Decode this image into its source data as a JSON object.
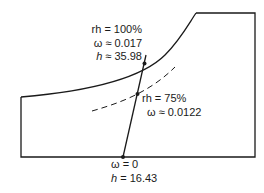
{
  "diagram": {
    "type": "psychrometric-chart-sketch",
    "saturation_point": {
      "rh_label": "rh = 100%",
      "omega_label": "ω ≈ 0.017",
      "h_symbol": "h",
      "h_value": " ≈ 35.98"
    },
    "intermediate_point": {
      "rh_label": "rh = 75%",
      "omega_label": "ω ≈ 0.0122"
    },
    "dry_point": {
      "omega_label": "ω = 0",
      "h_symbol": "h",
      "h_value": " = 16.43"
    },
    "colors": {
      "line": "#1a1a1a",
      "background": "#ffffff"
    }
  }
}
